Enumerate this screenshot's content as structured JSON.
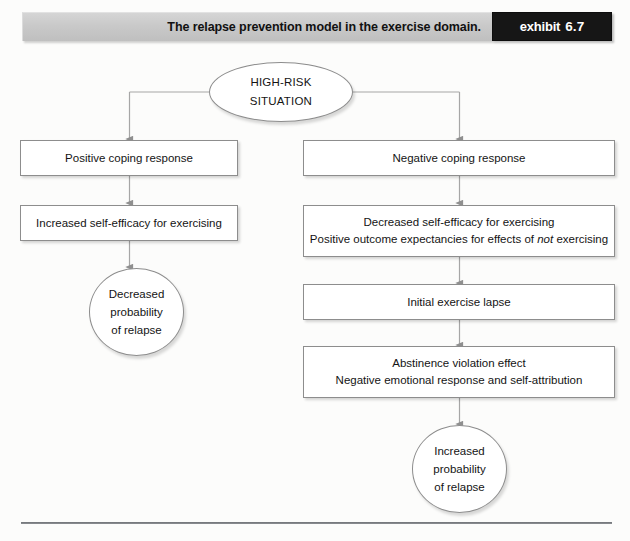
{
  "header": {
    "title": "The relapse prevention model in the exercise domain.",
    "exhibit_word": "exhibit",
    "exhibit_number": "6.7"
  },
  "diagram": {
    "type": "flowchart",
    "nodes": {
      "high_risk": {
        "shape": "oval",
        "lines": [
          "HIGH-RISK",
          "SITUATION"
        ]
      },
      "positive_coping": {
        "shape": "box",
        "lines": [
          "Positive coping response"
        ]
      },
      "increased_self_efficacy": {
        "shape": "box",
        "lines": [
          "Increased self-efficacy for exercising"
        ]
      },
      "decreased_probability": {
        "shape": "oval",
        "lines": [
          "Decreased",
          "probability",
          "of relapse"
        ]
      },
      "negative_coping": {
        "shape": "box",
        "lines": [
          "Negative coping response"
        ]
      },
      "decreased_self_efficacy": {
        "shape": "box",
        "lines": [
          "Decreased self-efficacy for exercising"
        ],
        "line_with_italic": {
          "before": "Positive outcome expectancies for effects of ",
          "italic": "not",
          "after": " exercising"
        }
      },
      "initial_lapse": {
        "shape": "box",
        "lines": [
          "Initial exercise lapse"
        ]
      },
      "abstinence_violation": {
        "shape": "box",
        "lines": [
          "Abstinence violation effect",
          "Negative emotional response and self-attribution"
        ]
      },
      "increased_probability": {
        "shape": "oval",
        "lines": [
          "Increased",
          "probability",
          "of relapse"
        ]
      }
    },
    "edges": [
      {
        "from": "high_risk",
        "to": "positive_coping",
        "style": "elbow-left"
      },
      {
        "from": "high_risk",
        "to": "negative_coping",
        "style": "elbow-right"
      },
      {
        "from": "positive_coping",
        "to": "increased_self_efficacy",
        "style": "straight"
      },
      {
        "from": "increased_self_efficacy",
        "to": "decreased_probability",
        "style": "straight"
      },
      {
        "from": "negative_coping",
        "to": "decreased_self_efficacy",
        "style": "straight"
      },
      {
        "from": "decreased_self_efficacy",
        "to": "initial_lapse",
        "style": "straight"
      },
      {
        "from": "initial_lapse",
        "to": "abstinence_violation",
        "style": "straight"
      },
      {
        "from": "abstinence_violation",
        "to": "increased_probability",
        "style": "straight"
      }
    ]
  },
  "colors": {
    "header_tag_bg": "#161616",
    "header_bar_bg": "#c9c9c9",
    "node_border": "#8d8d8d",
    "connector": "#9a9a9a",
    "text": "#141414"
  }
}
